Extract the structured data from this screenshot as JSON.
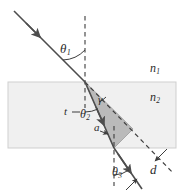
{
  "figure": {
    "type": "optics-refraction-slab-diagram"
  },
  "colors": {
    "ray": "#4d4d4d",
    "dashed": "#3d3d3d",
    "slab_fill": "#f0f0f0",
    "slab_stroke": "#cccccc",
    "triangle_fill": "#b3b3b3",
    "triangle_stroke": "#8c8c8c",
    "label": "#2b2b2b"
  },
  "labels": {
    "theta1": {
      "base": "θ",
      "sub": "1"
    },
    "theta2": {
      "base": "θ",
      "sub": "2"
    },
    "theta3": {
      "base": "θ",
      "sub": "3"
    },
    "gamma": {
      "base": "γ",
      "sub": ""
    },
    "a": {
      "base": "a",
      "sub": ""
    },
    "t": {
      "base": "t",
      "sub": ""
    },
    "d": {
      "base": "d",
      "sub": ""
    },
    "n1": {
      "base": "n",
      "sub": "1"
    },
    "n2": {
      "base": "n",
      "sub": "2"
    }
  },
  "geometry": {
    "slab": {
      "x": 8,
      "y": 82,
      "width": 168,
      "height": 66
    },
    "entry_point": [
      85,
      82
    ],
    "exit_point": [
      114,
      148
    ],
    "incident_start": [
      14,
      11
    ],
    "exit_end": [
      141,
      188
    ],
    "normal_top": {
      "x": 85,
      "y1": 16,
      "y2": 108
    },
    "normal_bottom": {
      "x": 114,
      "y1": 126,
      "y2": 186
    },
    "undeviated_end": [
      172,
      172
    ]
  }
}
